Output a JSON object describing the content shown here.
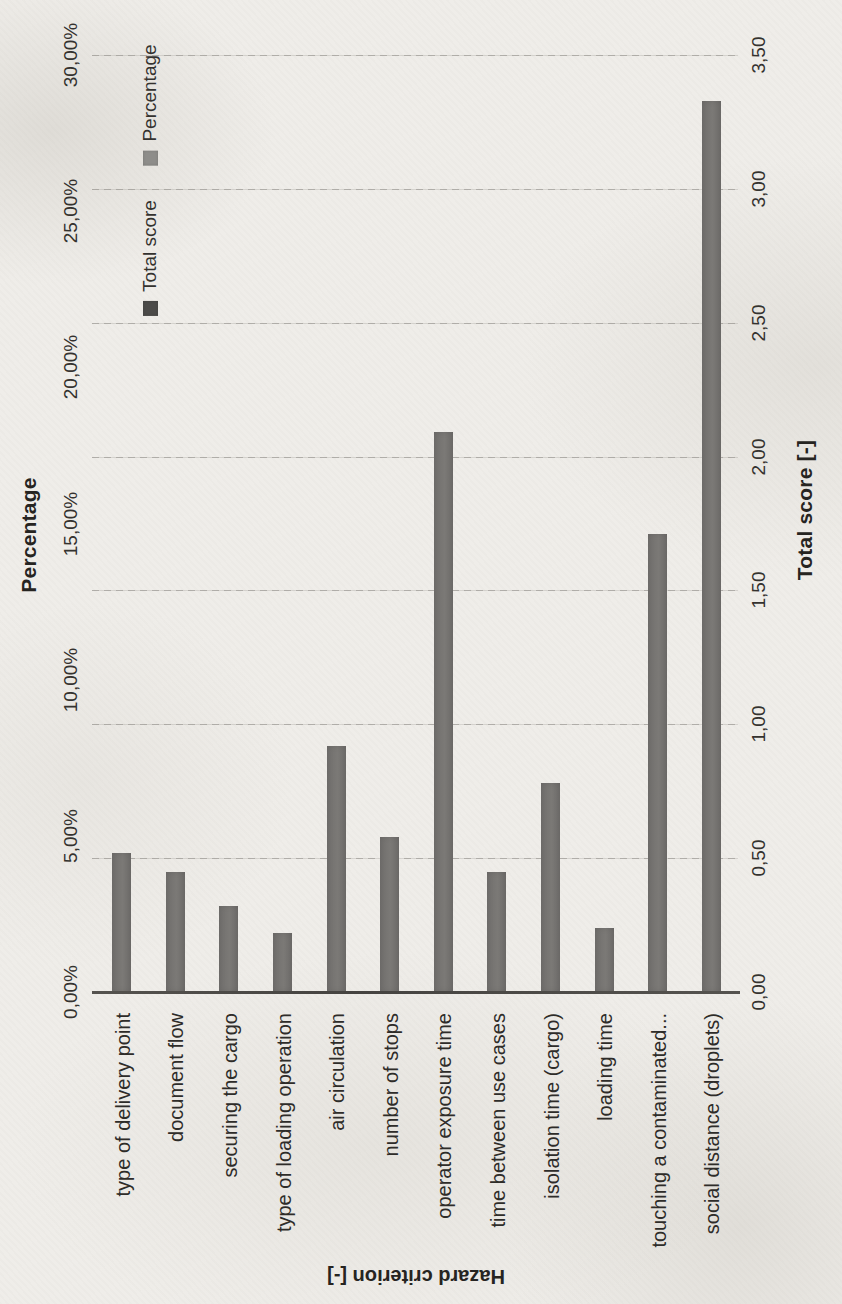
{
  "page": {
    "kind": "scanned book page",
    "background_color": "#efede9"
  },
  "chart_data": {
    "type": "bar",
    "orientation_note": "entire chart printed rotated 90deg CCW on the page; all text vertical (reads bottom-to-top), category-axis title rotated 180deg",
    "title": "Percentage",
    "categories": [
      "type of delivery point",
      "document flow",
      "securing the cargo",
      "type of loading operation",
      "air circulation",
      "number of stops",
      "operator exposure time",
      "time between use cases",
      "isolation time (cargo)",
      "loading time",
      "touching a contaminated...",
      "social distance (droplets)"
    ],
    "series": [
      {
        "name": "Total score",
        "axis": "secondary",
        "values": [
          0.52,
          0.45,
          0.32,
          0.22,
          0.92,
          0.58,
          2.09,
          0.45,
          0.78,
          0.24,
          1.71,
          3.33
        ],
        "color": "#4c4b49"
      },
      {
        "name": "Percentage",
        "axis": "primary",
        "values": [
          4.5,
          3.9,
          2.7,
          1.9,
          7.9,
          5.0,
          17.9,
          3.9,
          6.7,
          2.1,
          14.7,
          28.5
        ],
        "color": "#8e8d8a"
      }
    ],
    "note": "the two series overlap exactly, so a single gray bar is visible per category",
    "bar_color": "#757371",
    "primary_axis": {
      "title": "Percentage",
      "min": 0,
      "max": 30,
      "step": 5,
      "tick_labels": [
        "0,00%",
        "5,00%",
        "10,00%",
        "15,00%",
        "20,00%",
        "25,00%",
        "30,00%"
      ]
    },
    "secondary_axis": {
      "title": "Total score [-]",
      "min": 0,
      "max": 3.5,
      "step": 0.5,
      "tick_labels": [
        "0,00",
        "0,50",
        "1,00",
        "1,50",
        "2,00",
        "2,50",
        "3,00",
        "3,50"
      ]
    },
    "category_axis": {
      "title": "Hazard criterion [-]"
    },
    "legend_items": [
      {
        "label": "Percentage",
        "color": "#8e8d8a"
      },
      {
        "label": "Total score",
        "color": "#4c4b49"
      }
    ],
    "grid": "horizontal gridlines at every 0,50 of the secondary (Total score) axis",
    "legend_position": "inside plot, upper-left band"
  }
}
